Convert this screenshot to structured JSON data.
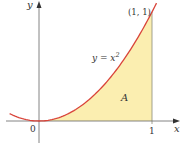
{
  "figure": {
    "curve_label_lhs": "y = x",
    "curve_label_exp": "2",
    "point_label": "(1, 1)",
    "region_label": "A",
    "x_axis_label": "x",
    "y_axis_label": "y",
    "origin_label": "0",
    "tick_label_1": "1"
  },
  "chart_data": {
    "type": "line",
    "title": "",
    "function": "y = x^2",
    "x_range_drawn": [
      -0.26,
      1.04
    ],
    "shaded_region": {
      "label": "A",
      "from_x": 0,
      "to_x": 1,
      "under": "y = x^2"
    },
    "marked_point": {
      "x": 1,
      "y": 1,
      "label": "(1, 1)"
    },
    "xlabel": "x",
    "ylabel": "y",
    "x_ticks": [
      "0",
      "1"
    ],
    "colors": {
      "curve": "#d9443a",
      "fill": "#fbeeb0",
      "axis": "#555555"
    }
  }
}
